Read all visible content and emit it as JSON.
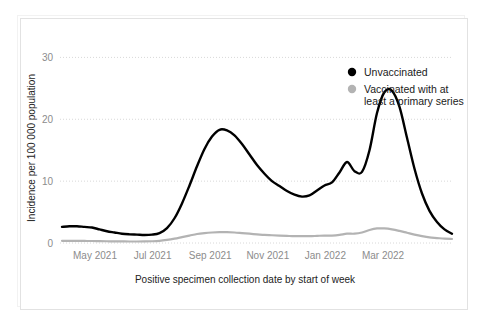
{
  "chart_data": {
    "type": "line",
    "title": "",
    "xlabel": "Positive specimen collection date by start of week",
    "ylabel": "Incidence per 100 000 population",
    "ylim": [
      0,
      32
    ],
    "yticks": [
      0,
      10,
      20,
      30
    ],
    "ytick_labels": [
      "0",
      "10",
      "20",
      "30"
    ],
    "xtick_labels": [
      "May 2021",
      "Jul 2021",
      "Sep 2021",
      "Nov 2021",
      "Jan 2022",
      "Mar 2022"
    ],
    "grid": "horizontal-dotted",
    "legend_position": "top-right",
    "x": [
      "2021-04-11",
      "2021-04-18",
      "2021-04-25",
      "2021-05-02",
      "2021-05-09",
      "2021-05-16",
      "2021-05-23",
      "2021-05-30",
      "2021-06-06",
      "2021-06-13",
      "2021-06-20",
      "2021-06-27",
      "2021-07-04",
      "2021-07-11",
      "2021-07-18",
      "2021-07-25",
      "2021-08-01",
      "2021-08-08",
      "2021-08-15",
      "2021-08-22",
      "2021-08-29",
      "2021-09-05",
      "2021-09-12",
      "2021-09-19",
      "2021-09-26",
      "2021-10-03",
      "2021-10-10",
      "2021-10-17",
      "2021-10-24",
      "2021-10-31",
      "2021-11-07",
      "2021-11-14",
      "2021-11-21",
      "2021-11-28",
      "2021-12-05",
      "2021-12-12",
      "2021-12-19",
      "2021-12-26",
      "2022-01-02",
      "2022-01-09",
      "2022-01-16",
      "2022-01-23",
      "2022-01-30",
      "2022-02-06",
      "2022-02-13",
      "2022-02-20",
      "2022-02-27",
      "2022-03-06",
      "2022-03-13",
      "2022-03-20",
      "2022-03-27",
      "2022-04-03",
      "2022-04-10"
    ],
    "series": [
      {
        "name": "Unvaccinated",
        "color": "#000000",
        "marker": "circle",
        "values": [
          2.6,
          2.7,
          2.7,
          2.6,
          2.5,
          2.2,
          1.9,
          1.7,
          1.5,
          1.4,
          1.35,
          1.3,
          1.35,
          1.6,
          2.4,
          4.0,
          6.4,
          9.3,
          12.4,
          15.2,
          17.2,
          18.3,
          18.2,
          17.4,
          16.0,
          14.3,
          12.6,
          11.2,
          10.0,
          9.2,
          8.4,
          7.8,
          7.5,
          7.7,
          8.5,
          9.3,
          9.8,
          11.4,
          13.1,
          11.6,
          11.5,
          15.0,
          21.0,
          24.4,
          24.6,
          22.0,
          17.0,
          12.0,
          8.0,
          5.2,
          3.4,
          2.2,
          1.5
        ]
      },
      {
        "name": "Vaccinated with at least a primary series",
        "color": "#b3b3b3",
        "marker": "circle",
        "values": [
          0.35,
          0.35,
          0.34,
          0.33,
          0.32,
          0.3,
          0.28,
          0.26,
          0.25,
          0.24,
          0.24,
          0.25,
          0.28,
          0.35,
          0.5,
          0.7,
          0.95,
          1.2,
          1.45,
          1.6,
          1.7,
          1.75,
          1.75,
          1.7,
          1.6,
          1.5,
          1.4,
          1.3,
          1.25,
          1.2,
          1.15,
          1.1,
          1.1,
          1.1,
          1.15,
          1.2,
          1.2,
          1.3,
          1.5,
          1.5,
          1.7,
          2.1,
          2.35,
          2.35,
          2.2,
          1.95,
          1.65,
          1.35,
          1.1,
          0.9,
          0.8,
          0.7,
          0.65
        ]
      }
    ]
  },
  "legend": {
    "items": [
      {
        "label": "Unvaccinated",
        "color": "#000000"
      },
      {
        "label": "Vaccinated with at least a primary series",
        "color": "#b3b3b3"
      }
    ],
    "line2_first": "Vaccinated with at",
    "line2_second": "least a primary series"
  },
  "axes": {
    "y_title": "Incidence per 100 000 population",
    "x_title": "Positive specimen collection date by start of week",
    "y_ticks": [
      "30",
      "20",
      "10",
      "0"
    ],
    "x_ticks": [
      "May 2021",
      "Jul 2021",
      "Sep 2021",
      "Nov 2021",
      "Jan 2022",
      "Mar 2022"
    ]
  },
  "colors": {
    "unvaccinated": "#000000",
    "vaccinated": "#b3b3b3",
    "grid": "#d8d8d8",
    "tick_text": "#8c8c8c",
    "axis_text": "#222222",
    "frame": "#e2e2e2",
    "background": "#ffffff"
  }
}
